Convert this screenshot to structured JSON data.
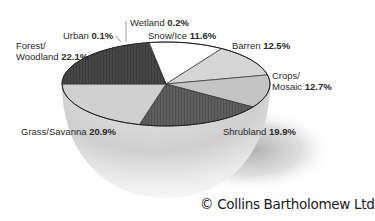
{
  "chart_data": {
    "type": "pie",
    "title": "",
    "style": "3d-bowl",
    "categories": [
      "Wetland",
      "Snow/Ice",
      "Barren",
      "Crops/Mosaic",
      "Shrubland",
      "Grass/Savanna",
      "Forest/Woodland",
      "Urban"
    ],
    "values": [
      0.2,
      11.6,
      12.5,
      12.7,
      19.9,
      20.9,
      22.1,
      0.1
    ],
    "unit": "%",
    "slices": [
      {
        "name": "Wetland",
        "label": "Wetland",
        "value": 0.2,
        "value_text": "0.2%",
        "color": "#9a9a9a"
      },
      {
        "name": "Snow/Ice",
        "label": "Snow/Ice",
        "value": 11.6,
        "value_text": "11.6%",
        "color": "#ffffff"
      },
      {
        "name": "Barren",
        "label": "Barren",
        "value": 12.5,
        "value_text": "12.5%",
        "color": "#d6d6d6"
      },
      {
        "name": "Crops/Mosaic",
        "label_line1": "Crops/",
        "label_line2": "Mosaic",
        "value": 12.7,
        "value_text": "12.7%",
        "color": "#c4c4c4"
      },
      {
        "name": "Shrubland",
        "label": "Shrubland",
        "value": 19.9,
        "value_text": "19.9%",
        "color": "#5a5a5a"
      },
      {
        "name": "Grass/Savanna",
        "label": "Grass/Savanna",
        "value": 20.9,
        "value_text": "20.9%",
        "color": "#d0d0d0"
      },
      {
        "name": "Forest/Woodland",
        "label_line1": "Forest/",
        "label_line2": "Woodland",
        "value": 22.1,
        "value_text": "22.1%",
        "color": "#3e3e3e"
      },
      {
        "name": "Urban",
        "label": "Urban",
        "value": 0.1,
        "value_text": "0.1%",
        "color": "#888888"
      }
    ],
    "legend": "none (direct labels)"
  },
  "credit": "© Collins Bartholomew Ltd"
}
